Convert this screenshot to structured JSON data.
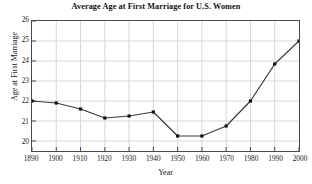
{
  "chart_data": {
    "type": "line",
    "title": "Average Age at First Marriage for U.S. Women",
    "xlabel": "Year",
    "ylabel": "Age at First Marriage",
    "x": [
      1890,
      1900,
      1910,
      1920,
      1930,
      1940,
      1950,
      1960,
      1970,
      1980,
      1990,
      2000
    ],
    "categories": [
      "1890",
      "1900",
      "1910",
      "1920",
      "1930",
      "1940",
      "1950",
      "1960",
      "1970",
      "1980",
      "1990",
      "2000"
    ],
    "values": [
      22.0,
      21.9,
      21.6,
      21.15,
      21.25,
      21.45,
      20.25,
      20.25,
      20.75,
      22.0,
      23.85,
      25.0
    ],
    "series": [
      {
        "name": "Average age at first marriage",
        "values": [
          22.0,
          21.9,
          21.6,
          21.15,
          21.25,
          21.45,
          20.25,
          20.25,
          20.75,
          22.0,
          23.85,
          25.0
        ]
      }
    ],
    "xlim": [
      1890,
      2000
    ],
    "ylim": [
      19.5,
      26
    ],
    "xticks": [
      1890,
      1900,
      1910,
      1920,
      1930,
      1940,
      1950,
      1960,
      1970,
      1980,
      1990,
      2000
    ],
    "xtick_labels": [
      "1890",
      "1900",
      "1910",
      "1920",
      "1930",
      "1940",
      "1950",
      "1960",
      "1970",
      "1980",
      "1990",
      "2000"
    ],
    "yticks": [
      20,
      21,
      22,
      23,
      24,
      25,
      26
    ],
    "ytick_labels": [
      "20",
      "21",
      "22",
      "23",
      "24",
      "25",
      "26"
    ],
    "grid": true,
    "grid_color": "#d8d8d8",
    "line_color": "#3a3a3a",
    "marker": "square",
    "marker_color": "#111111",
    "legend": null,
    "legend_position": "none",
    "background_color": "#ffffff",
    "axis_color": "#4a4a4a"
  }
}
